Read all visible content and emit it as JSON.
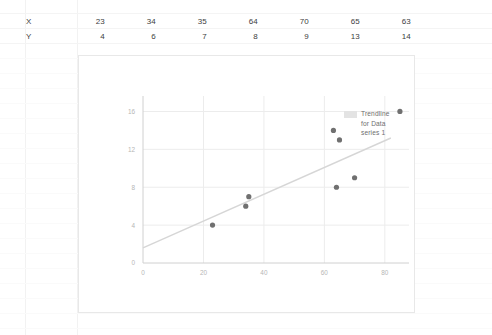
{
  "spreadsheet": {
    "rows": [
      {
        "label": "X",
        "name": "row-x",
        "values": [
          "23",
          "34",
          "35",
          "64",
          "70",
          "65",
          "63"
        ]
      },
      {
        "label": "Y",
        "name": "row-y",
        "values": [
          "4",
          "6",
          "7",
          "8",
          "9",
          "13",
          "14"
        ]
      }
    ],
    "column_x_positions": [
      105,
      156,
      207,
      258,
      309,
      360,
      411
    ]
  },
  "chart": {
    "legend": {
      "label": "Trendline\nfor Data\nseries 1",
      "swatch_color": "#e3e3e3"
    },
    "colors": {
      "marker": "#707070",
      "trendline": "#d6d6d6",
      "gridline": "#ececec",
      "axis": "#d0d0d0",
      "tick_text": "#b6b6b6",
      "frame_border": "#e8e8e8"
    }
  },
  "chart_data": {
    "type": "scatter",
    "title": "",
    "xlabel": "",
    "ylabel": "",
    "xlim": [
      0,
      88
    ],
    "ylim": [
      0,
      17
    ],
    "xticks": [
      "0",
      "20",
      "40",
      "60",
      "80"
    ],
    "xtick_values": [
      0,
      20,
      40,
      60,
      80
    ],
    "yticks": [
      "0",
      "4",
      "8",
      "12",
      "16"
    ],
    "ytick_values": [
      0,
      4,
      8,
      12,
      16
    ],
    "grid": true,
    "legend_position": "right",
    "series": [
      {
        "name": "Data series 1",
        "type": "scatter",
        "x": [
          23,
          34,
          35,
          64,
          70,
          65,
          63,
          85
        ],
        "y": [
          4,
          6,
          7,
          8,
          9,
          13,
          14,
          16
        ]
      },
      {
        "name": "Trendline for Data series 1",
        "type": "line",
        "x": [
          0,
          82
        ],
        "y": [
          1.6,
          13.2
        ]
      }
    ]
  }
}
